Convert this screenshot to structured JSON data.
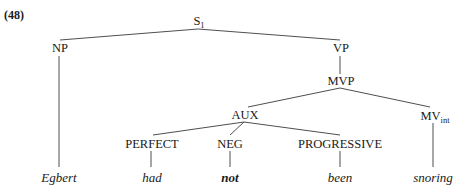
{
  "example_label": "(48)",
  "tree": {
    "root": {
      "label": "S",
      "subscript": "1"
    },
    "nodes": {
      "np": "NP",
      "vp": "VP",
      "mvp": "MVP",
      "aux": "AUX",
      "mv": {
        "label": "MV",
        "subscript": "int"
      },
      "perfect": "PERFECT",
      "neg": "NEG",
      "progressive": "PROGRESSIVE"
    },
    "terminals": {
      "egbert": "Egbert",
      "had": "had",
      "not": "not",
      "been": "been",
      "snoring": "snoring"
    }
  }
}
